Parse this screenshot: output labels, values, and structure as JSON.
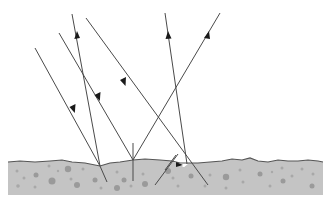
{
  "diagram": {
    "title": "",
    "colors": {
      "ray": "#4a4a4a",
      "arrowhead": "#1a1a1a",
      "ground_fill": "#c4c4c4",
      "ground_surface_line": "#555555",
      "grain": "#a8a8a8",
      "background": "#ffffff"
    },
    "elements": [
      {
        "type": "incident-ray",
        "direction": "down"
      },
      {
        "type": "reflected-ray",
        "direction": "up"
      },
      {
        "type": "incident-ray",
        "direction": "down"
      },
      {
        "type": "incident-ray",
        "direction": "down"
      },
      {
        "type": "reflected-ray",
        "direction": "up"
      },
      {
        "type": "reflected-ray",
        "direction": "up"
      },
      {
        "type": "surface-normal"
      },
      {
        "type": "rough-ground-surface"
      }
    ],
    "labels": []
  }
}
